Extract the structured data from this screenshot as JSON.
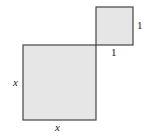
{
  "diagram": {
    "type": "geometry-squares",
    "fill_color": "#e6e6e6",
    "stroke_color": "#444444",
    "large_square": {
      "x": 23,
      "y": 45,
      "size": 73,
      "side_label_left": "x",
      "side_label_bottom": "x"
    },
    "small_square": {
      "x": 96,
      "y": 7,
      "size": 38,
      "side_label_right": "1",
      "side_label_bottom": "1"
    }
  }
}
